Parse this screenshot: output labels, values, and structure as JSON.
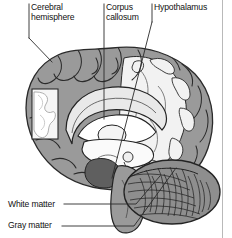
{
  "figure": {
    "kind": "anatomical-diagram",
    "background_color": "#ffffff",
    "line_color": "#1a1a1a",
    "gray_matter_color": "#9a9a9a",
    "white_matter_color": "#f2f2f2",
    "deep_structure_color": "#6f6f6f",
    "cerebellum_color": "#8e8e8e"
  },
  "labels": {
    "cerebral_hemisphere": "Cerebral\nhemisphere",
    "corpus_callosum": "Corpus\ncallosum",
    "hypothalamus": "Hypothalamus",
    "white_matter": "White matter",
    "gray_matter": "Gray matter"
  },
  "leaders": {
    "cerebral_hemisphere": {
      "from_x": 29,
      "from_y": 4,
      "to_x": 29,
      "to_y": 38,
      "elbow_x": 52,
      "elbow_y": 62
    },
    "corpus_callosum": {
      "from_x": 104,
      "from_y": 4,
      "to_x": 104,
      "to_y": 119
    },
    "hypothalamus": {
      "from_x": 152,
      "from_y": 4,
      "to_x": 152,
      "to_y": 22,
      "tip_x": 118,
      "tip_y": 175
    },
    "white_matter": {
      "from_x": 64,
      "from_y": 204,
      "to_x": 136,
      "to_y": 204,
      "tip_x": 160,
      "tip_y": 176
    },
    "gray_matter": {
      "from_x": 62,
      "from_y": 226,
      "to_x": 136,
      "to_y": 226,
      "tip_x": 175,
      "tip_y": 168
    }
  },
  "regions": [
    {
      "name": "cerebral-cortex-gray-matter"
    },
    {
      "name": "cerebral-white-matter"
    },
    {
      "name": "corpus-callosum"
    },
    {
      "name": "lateral-ventricle"
    },
    {
      "name": "thalamus"
    },
    {
      "name": "hypothalamus"
    },
    {
      "name": "brainstem"
    },
    {
      "name": "cerebellum-arbor-vitae"
    },
    {
      "name": "white-matter-inset-window"
    }
  ]
}
